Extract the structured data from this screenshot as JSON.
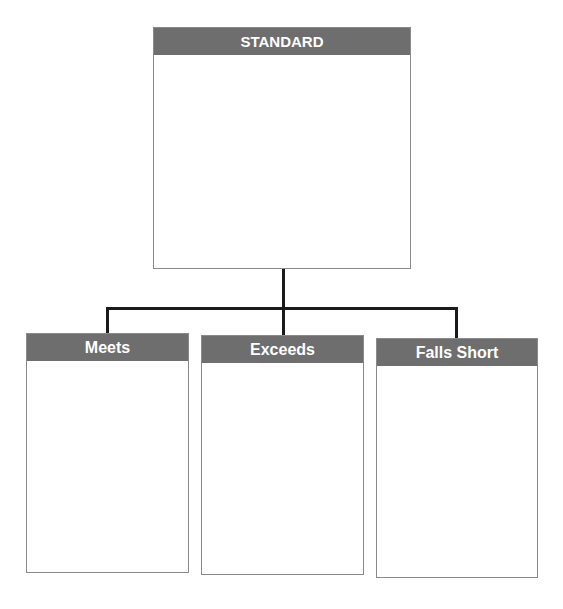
{
  "diagram": {
    "top": {
      "title": "STANDARD",
      "content": ""
    },
    "children": [
      {
        "title": "Meets",
        "content": ""
      },
      {
        "title": "Exceeds",
        "content": ""
      },
      {
        "title": "Falls Short",
        "content": ""
      }
    ]
  },
  "colors": {
    "header_bg": "#6e6e6e",
    "header_text": "#ffffff",
    "border": "#8a8a8a",
    "connector": "#1a1a1a"
  }
}
